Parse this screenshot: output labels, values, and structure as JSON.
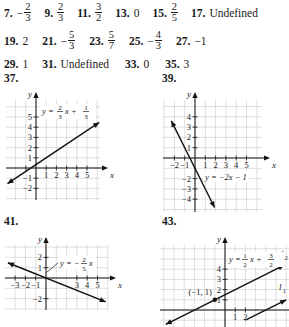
{
  "answers_row1": [
    {
      "num": "7.",
      "sign": "−",
      "n": "2",
      "d": "3"
    },
    {
      "num": "9.",
      "sign": "",
      "n": "2",
      "d": "3"
    },
    {
      "num": "11.",
      "sign": "",
      "n": "3",
      "d": "2"
    },
    {
      "num": "13.",
      "text": "0"
    },
    {
      "num": "15.",
      "sign": "",
      "n": "2",
      "d": "5"
    },
    {
      "num": "17.",
      "text": "Undefined"
    }
  ],
  "answers_row2": [
    {
      "num": "19.",
      "text": "2"
    },
    {
      "num": "21.",
      "sign": "−",
      "n": "5",
      "d": "3"
    },
    {
      "num": "23.",
      "sign": "",
      "n": "5",
      "d": "7"
    },
    {
      "num": "25.",
      "sign": "−",
      "n": "4",
      "d": "3"
    },
    {
      "num": "27.",
      "text": "−1"
    }
  ],
  "answers_row3": [
    {
      "num": "29.",
      "text": "1"
    },
    {
      "num": "31.",
      "text": "Undefined"
    },
    {
      "num": "33.",
      "text": "0"
    },
    {
      "num": "35.",
      "text": "3"
    }
  ],
  "problem_labels": {
    "p37": "37.",
    "p39": "39.",
    "p41": "41.",
    "p43": "43."
  },
  "chart_data": [
    {
      "type": "line",
      "problem": "37",
      "xlabel": "x",
      "ylabel": "y",
      "xlim": [
        -3,
        6
      ],
      "ylim": [
        -3,
        6
      ],
      "grid": true,
      "x_ticks": [
        -1,
        1,
        2,
        3,
        4,
        5
      ],
      "x_tick_labels": [
        "",
        "1",
        "2",
        "3",
        "4",
        "5"
      ],
      "y_ticks": [
        -2,
        -1,
        1,
        2,
        3,
        4,
        5
      ],
      "y_tick_labels": [
        "−2",
        "−1",
        "1",
        "2",
        "3",
        "4",
        "5"
      ],
      "series": [
        {
          "name": "y = (2/3)x + 1/3",
          "slope": 0.6667,
          "intercept": 0.3333,
          "x_range": [
            -2.8,
            6.2
          ]
        }
      ],
      "annotation": {
        "text_prefix": "y = ",
        "n1": "2",
        "d1": "3",
        "mid": "x + ",
        "n2": "1",
        "d2": "3"
      }
    },
    {
      "type": "line",
      "problem": "39",
      "xlabel": "x",
      "ylabel": "y",
      "xlim": [
        -3,
        6
      ],
      "ylim": [
        -5,
        5
      ],
      "grid": true,
      "x_ticks": [
        -2,
        -1,
        1,
        2,
        3,
        4,
        5
      ],
      "x_tick_labels": [
        "−2",
        "−1",
        "1",
        "2",
        "3",
        "4",
        "5"
      ],
      "y_ticks": [
        -4,
        -3,
        -2,
        1,
        2,
        3,
        4
      ],
      "y_tick_labels": [
        "−4",
        "−3",
        "−2",
        "1",
        "2",
        "3",
        "4"
      ],
      "series": [
        {
          "name": "y = −2x − 1",
          "slope": -2,
          "intercept": -1,
          "x_range": [
            -2.3,
            1.9
          ]
        }
      ],
      "annotation": {
        "text": "y = −2x − 1"
      }
    },
    {
      "type": "line",
      "problem": "41",
      "xlabel": "x",
      "ylabel": "y",
      "xlim": [
        -4,
        6
      ],
      "ylim": [
        -3,
        3
      ],
      "grid": true,
      "x_ticks": [
        -3,
        -2,
        -1,
        3,
        4,
        5
      ],
      "x_tick_labels": [
        "−3",
        "−2",
        "−1",
        "3",
        "4",
        "5"
      ],
      "y_ticks": [
        -2,
        1,
        2
      ],
      "y_tick_labels": [
        "−2",
        "1",
        "2"
      ],
      "series": [
        {
          "name": "y = −(2/5)x",
          "slope": -0.4,
          "intercept": 0,
          "x_range": [
            -3.7,
            5.8
          ]
        }
      ],
      "annotation": {
        "text_prefix": "y = −",
        "n1": "2",
        "d1": "5",
        "mid": "x"
      }
    },
    {
      "type": "line",
      "problem": "43",
      "xlabel": "x",
      "ylabel": "y",
      "xlim": [
        -6,
        3
      ],
      "ylim": [
        -1,
        5
      ],
      "grid": true,
      "x_ticks": [
        1,
        2
      ],
      "x_tick_labels": [
        "1",
        "2"
      ],
      "y_ticks": [
        1,
        2,
        3,
        4
      ],
      "y_tick_labels": [
        "1",
        "2",
        "3",
        "4"
      ],
      "series": [
        {
          "name": "l2: y = (1/2)x + 3/2",
          "label": "l",
          "sub": "2",
          "slope": 0.5,
          "intercept": 1.5,
          "x_range": [
            -5.8,
            5.8
          ]
        },
        {
          "name": "l1",
          "label": "l",
          "sub": "1",
          "slope": 0.5,
          "intercept": -2.0,
          "x_range": [
            2.0,
            6.0
          ]
        }
      ],
      "point": {
        "x": -1,
        "y": 1,
        "label": "(−1, 1)"
      },
      "annotation": {
        "text_prefix": "y = ",
        "n1": "1",
        "d1": "2",
        "mid": "x + ",
        "n2": "3",
        "d2": "2"
      }
    }
  ]
}
